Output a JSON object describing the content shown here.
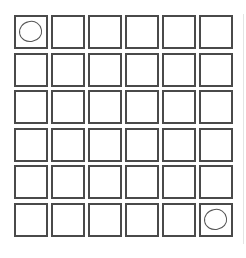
{
  "board": {
    "rows": 6,
    "cols": 6,
    "colors": {
      "border": "#4a4a4a",
      "mark": "#555555",
      "background": "#ffffff"
    },
    "marked_cells": [
      {
        "row": 0,
        "col": 0,
        "mark": "circle"
      },
      {
        "row": 5,
        "col": 5,
        "mark": "circle"
      }
    ]
  }
}
